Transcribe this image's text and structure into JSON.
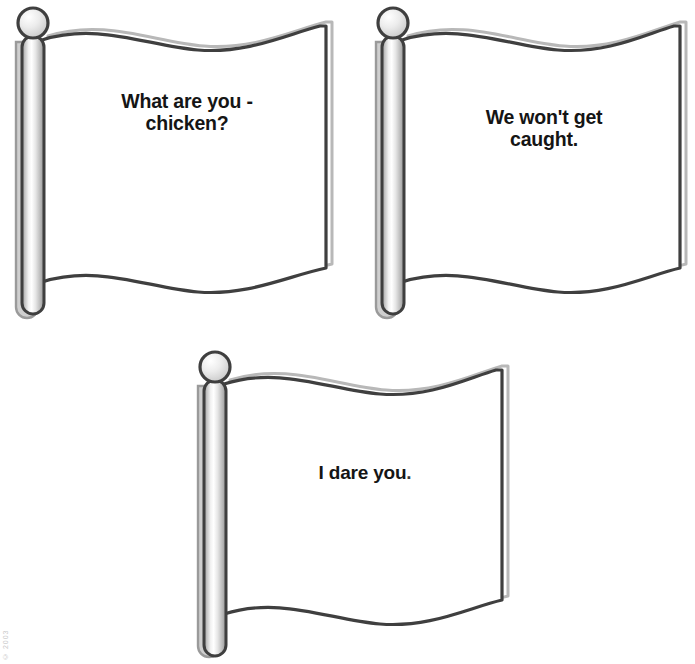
{
  "page": {
    "background_color": "#ffffff",
    "ink_color": "#3a3a3a",
    "text_color": "#151515",
    "width": 695,
    "height": 664
  },
  "corner_credit": "© 2003",
  "flags": [
    {
      "id": "flag-1",
      "caption": "What are you -\nchicken?",
      "caption_line_1": "What are you -",
      "caption_line_2": "chicken?",
      "pole_label": "flagpole",
      "knob_label": "finial knob",
      "position": {
        "x": 4,
        "y": 2
      },
      "size": {
        "width": 340,
        "height": 330
      }
    },
    {
      "id": "flag-2",
      "caption": "We won't get\ncaught.",
      "caption_line_1": "We won't get",
      "caption_line_2": "caught.",
      "pole_label": "flagpole",
      "knob_label": "finial knob",
      "position": {
        "x": 366,
        "y": 2
      },
      "size": {
        "width": 329,
        "height": 330
      }
    },
    {
      "id": "flag-3",
      "caption": "I dare you.",
      "caption_line_1": "I dare you",
      "caption_line_2": ".",
      "pole_label": "flagpole",
      "knob_label": "finial knob",
      "position": {
        "x": 180,
        "y": 338
      },
      "size": {
        "width": 330,
        "height": 326
      }
    }
  ],
  "colors": {
    "outline": "#3f3f3f",
    "outline_light": "#8d8d8d",
    "pole_dark": "#8f8f8f",
    "pole_mid": "#d7d7d7",
    "pole_light": "#fdfdfd",
    "knob_fill": "#e3e3e3",
    "flag_fill": "#ffffff",
    "shadow": "#b9b9b9"
  }
}
